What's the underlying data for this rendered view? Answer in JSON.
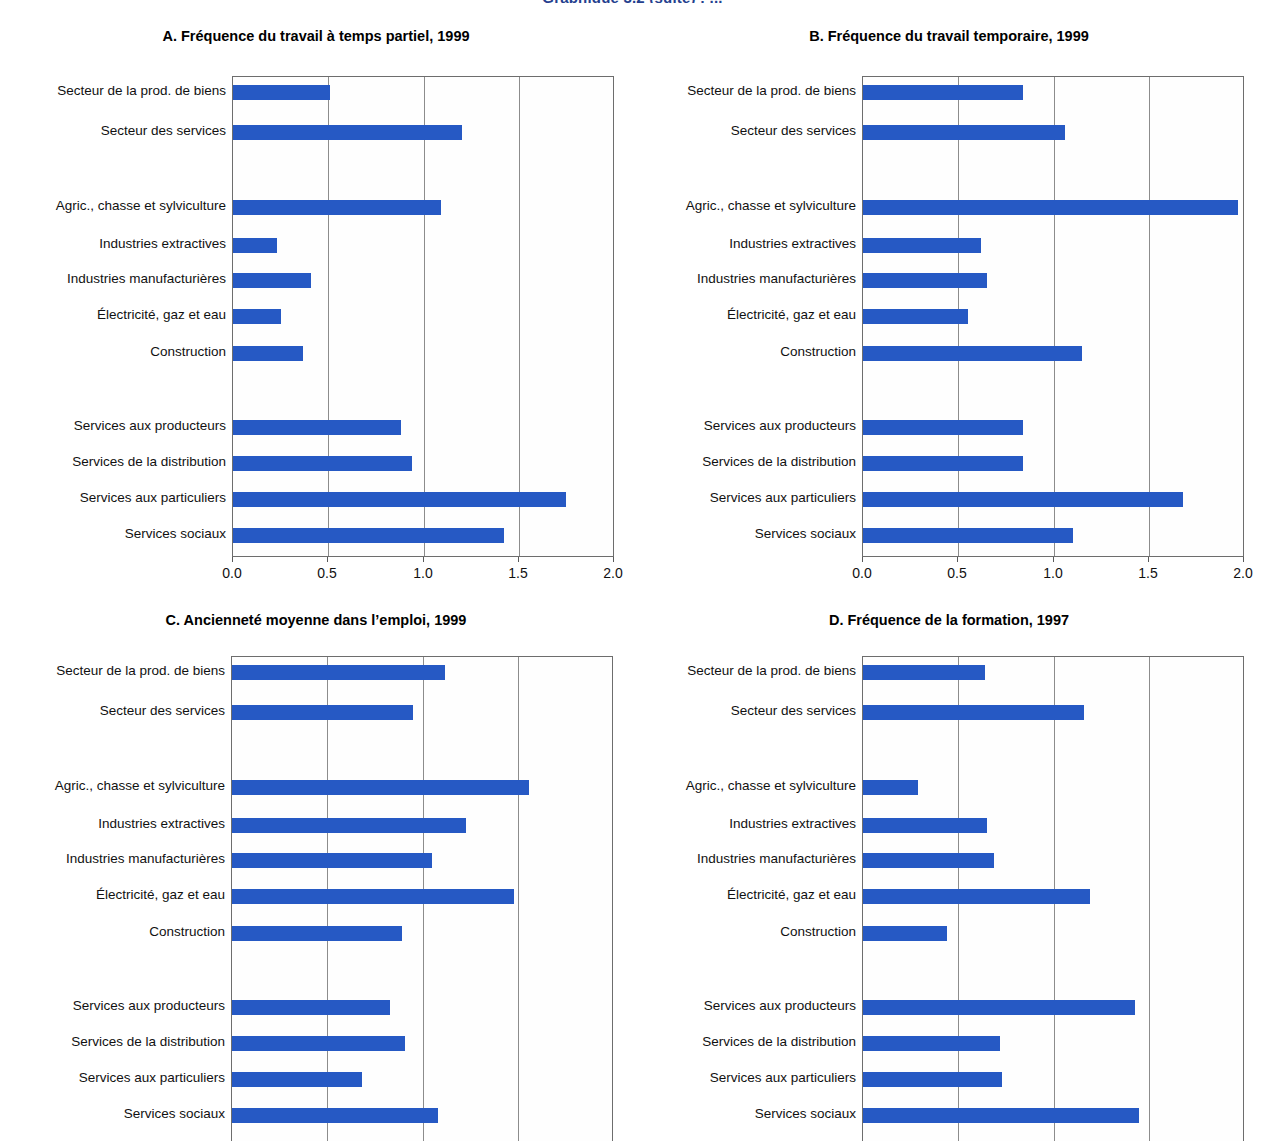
{
  "page": {
    "header_partial": "Graphique 3.2 (suite) : ..."
  },
  "categories": [
    "Secteur de la prod. de biens",
    "Secteur des services",
    "Agric., chasse et sylviculture",
    "Industries extractives",
    "Industries manufacturières",
    "Électricité, gaz et eau",
    "Construction",
    "Services aux producteurs",
    "Services de la distribution",
    "Services aux particuliers",
    "Services sociaux"
  ],
  "axis": {
    "ticks": [
      "0.0",
      "0.5",
      "1.0",
      "1.5",
      "2.0"
    ],
    "min": 0,
    "max": 2.0
  },
  "colors": {
    "bar": "#2659c4",
    "axis": "#6d6d6d",
    "grid": "#8c8c8c",
    "header": "#24408e"
  },
  "chart_data": [
    {
      "id": "A",
      "type": "bar",
      "orientation": "horizontal",
      "title": "A. Fréquence du travail à temps partiel, 1999",
      "xlabel": "",
      "ylabel": "",
      "xlim": [
        0,
        2.0
      ],
      "xticks": [
        0.0,
        0.5,
        1.0,
        1.5,
        2.0
      ],
      "grid": true,
      "legend": "none",
      "categories": [
        "Secteur de la prod. de biens",
        "Secteur des services",
        "Agric., chasse et sylviculture",
        "Industries extractives",
        "Industries manufacturières",
        "Électricité, gaz et eau",
        "Construction",
        "Services aux producteurs",
        "Services de la distribution",
        "Services aux particuliers",
        "Services sociaux"
      ],
      "values": [
        0.51,
        1.2,
        1.09,
        0.23,
        0.41,
        0.25,
        0.37,
        0.88,
        0.94,
        1.75,
        1.42
      ]
    },
    {
      "id": "B",
      "type": "bar",
      "orientation": "horizontal",
      "title": "B. Fréquence du travail temporaire, 1999",
      "xlabel": "",
      "ylabel": "",
      "xlim": [
        0,
        2.0
      ],
      "xticks": [
        0.0,
        0.5,
        1.0,
        1.5,
        2.0
      ],
      "grid": true,
      "legend": "none",
      "categories": [
        "Secteur de la prod. de biens",
        "Secteur des services",
        "Agric., chasse et sylviculture",
        "Industries extractives",
        "Industries manufacturières",
        "Électricité, gaz et eau",
        "Construction",
        "Services aux producteurs",
        "Services de la distribution",
        "Services aux particuliers",
        "Services sociaux"
      ],
      "values": [
        0.84,
        1.06,
        1.97,
        0.62,
        0.65,
        0.55,
        1.15,
        0.84,
        0.84,
        1.68,
        1.1
      ]
    },
    {
      "id": "C",
      "type": "bar",
      "orientation": "horizontal",
      "title": "C. Ancienneté moyenne dans l’emploi, 1999",
      "xlabel": "",
      "ylabel": "",
      "xlim": [
        0,
        2.0
      ],
      "xticks": [
        0.0,
        0.5,
        1.0,
        1.5,
        2.0
      ],
      "grid": true,
      "legend": "none",
      "categories": [
        "Secteur de la prod. de biens",
        "Secteur des services",
        "Agric., chasse et sylviculture",
        "Industries extractives",
        "Industries manufacturières",
        "Électricité, gaz et eau",
        "Construction",
        "Services aux producteurs",
        "Services de la distribution",
        "Services aux particuliers",
        "Services sociaux"
      ],
      "values": [
        1.12,
        0.95,
        1.56,
        1.23,
        1.05,
        1.48,
        0.89,
        0.83,
        0.91,
        0.68,
        1.08
      ]
    },
    {
      "id": "D",
      "type": "bar",
      "orientation": "horizontal",
      "title": "D. Fréquence de la formation, 1997",
      "xlabel": "",
      "ylabel": "",
      "xlim": [
        0,
        2.0
      ],
      "xticks": [
        0.0,
        0.5,
        1.0,
        1.5,
        2.0
      ],
      "grid": true,
      "legend": "none",
      "categories": [
        "Secteur de la prod. de biens",
        "Secteur des services",
        "Agric., chasse et sylviculture",
        "Industries extractives",
        "Industries manufacturières",
        "Électricité, gaz et eau",
        "Construction",
        "Services aux producteurs",
        "Services de la distribution",
        "Services aux particuliers",
        "Services sociaux"
      ],
      "values": [
        0.64,
        1.16,
        0.29,
        0.65,
        0.69,
        1.19,
        0.44,
        1.43,
        0.72,
        0.73,
        1.45
      ]
    }
  ]
}
